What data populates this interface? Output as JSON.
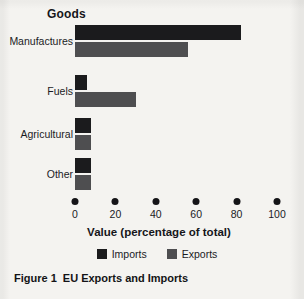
{
  "figure": {
    "caption_number": "Figure 1",
    "caption_text": "EU Exports and Imports",
    "group_title": "Goods"
  },
  "chart_data": {
    "type": "bar",
    "orientation": "horizontal",
    "title": "Goods",
    "xlabel": "Value (percentage of total)",
    "ylabel": "Goods",
    "xlim": [
      0,
      100
    ],
    "xticks": [
      0,
      20,
      40,
      60,
      80,
      100
    ],
    "xticklabels": [
      "0",
      "20",
      "40",
      "60",
      "80",
      "100"
    ],
    "grid": false,
    "legend_position": "bottom-center",
    "categories": [
      "Manufactures",
      "Fuels",
      "Agricultural",
      "Other"
    ],
    "series": [
      {
        "name": "Imports",
        "color": "#1b1b1d",
        "values": [
          82,
          6,
          8,
          8
        ]
      },
      {
        "name": "Exports",
        "color": "#4e4e50",
        "values": [
          56,
          30,
          8,
          8
        ]
      }
    ]
  },
  "legend": {
    "items": [
      {
        "label": "Imports",
        "color": "#1b1b1d"
      },
      {
        "label": "Exports",
        "color": "#4e4e50"
      }
    ]
  },
  "axis": {
    "title": "Value (percentage of total)"
  }
}
